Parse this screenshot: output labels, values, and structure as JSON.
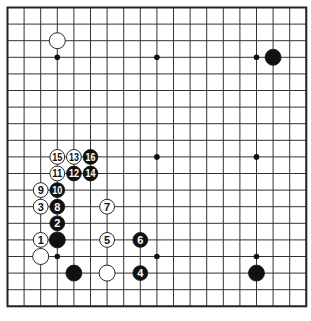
{
  "board": {
    "size": 19,
    "origin_x": 7.5,
    "origin_y": 7.5,
    "spacing": 16.6,
    "line_color": "#333333",
    "border_color": "#222222",
    "background": "#ffffff",
    "hoshi": [
      [
        4,
        4
      ],
      [
        10,
        4
      ],
      [
        16,
        4
      ],
      [
        4,
        10
      ],
      [
        10,
        10
      ],
      [
        16,
        10
      ],
      [
        4,
        16
      ],
      [
        10,
        16
      ],
      [
        16,
        16
      ]
    ],
    "stones": [
      {
        "col": 4,
        "row": 3,
        "color": "white",
        "label": ""
      },
      {
        "col": 17,
        "row": 4,
        "color": "black",
        "label": ""
      },
      {
        "col": 16,
        "row": 17,
        "color": "black",
        "label": ""
      },
      {
        "col": 4,
        "row": 10,
        "color": "white",
        "label": "15"
      },
      {
        "col": 5,
        "row": 10,
        "color": "white",
        "label": "13"
      },
      {
        "col": 6,
        "row": 10,
        "color": "black",
        "label": "16"
      },
      {
        "col": 4,
        "row": 11,
        "color": "white",
        "label": "11"
      },
      {
        "col": 5,
        "row": 11,
        "color": "black",
        "label": "12"
      },
      {
        "col": 6,
        "row": 11,
        "color": "black",
        "label": "14"
      },
      {
        "col": 3,
        "row": 12,
        "color": "white",
        "label": "9"
      },
      {
        "col": 4,
        "row": 12,
        "color": "black",
        "label": "10"
      },
      {
        "col": 3,
        "row": 13,
        "color": "white",
        "label": "3"
      },
      {
        "col": 4,
        "row": 13,
        "color": "black",
        "label": "8"
      },
      {
        "col": 7,
        "row": 13,
        "color": "white",
        "label": "7"
      },
      {
        "col": 4,
        "row": 14,
        "color": "black",
        "label": "2"
      },
      {
        "col": 3,
        "row": 15,
        "color": "white",
        "label": "1"
      },
      {
        "col": 4,
        "row": 15,
        "color": "black",
        "label": ""
      },
      {
        "col": 7,
        "row": 15,
        "color": "white",
        "label": "5"
      },
      {
        "col": 9,
        "row": 15,
        "color": "black",
        "label": "6"
      },
      {
        "col": 3,
        "row": 16,
        "color": "white",
        "label": ""
      },
      {
        "col": 5,
        "row": 17,
        "color": "black",
        "label": ""
      },
      {
        "col": 7,
        "row": 17,
        "color": "white",
        "label": ""
      },
      {
        "col": 9,
        "row": 17,
        "color": "black",
        "label": "4"
      }
    ]
  }
}
